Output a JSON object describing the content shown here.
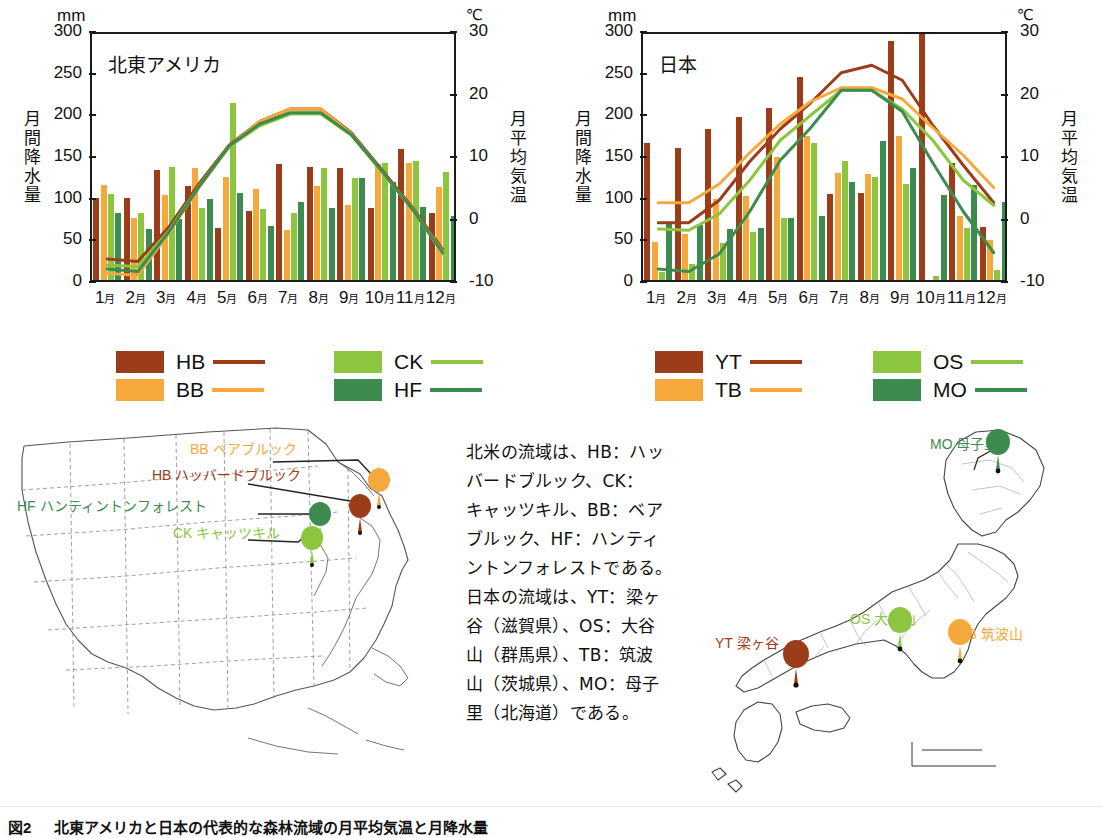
{
  "figure": {
    "caption_label": "図2",
    "caption_text": "北東アメリカと日本の代表的な森林流域の月平均気温と月降水量"
  },
  "colors": {
    "dark_red": "#9c3c19",
    "orange": "#f5a83c",
    "light_green": "#8cc63f",
    "dark_green": "#3d8b4f",
    "axis": "#1a1a1a"
  },
  "charts": [
    {
      "id": "northeast-america",
      "title": "北東アメリカ",
      "left_unit": "mm",
      "right_unit": "℃",
      "left_axis_title": "月間降水量",
      "right_axis_title": "月平均気温",
      "x_labels": [
        "1月",
        "2月",
        "3月",
        "4月",
        "5月",
        "6月",
        "7月",
        "8月",
        "9月",
        "10月",
        "11月",
        "12月"
      ],
      "y_left_ticks": [
        "0",
        "50",
        "100",
        "150",
        "200",
        "250",
        "300"
      ],
      "y_right_ticks": [
        "-10",
        "0",
        "10",
        "20",
        "30"
      ],
      "legend": [
        {
          "code": "HB",
          "color": "#9c3c19"
        },
        {
          "code": "BB",
          "color": "#f5a83c"
        },
        {
          "code": "CK",
          "color": "#8cc63f"
        },
        {
          "code": "HF",
          "color": "#3d8b4f"
        }
      ],
      "chart_data": {
        "type": "bar",
        "title": "北東アメリカ",
        "xlabel": "",
        "ylabel": "月間降水量 (mm)",
        "y2label": "月平均気温 (℃)",
        "ylim": [
          0,
          300
        ],
        "y2lim": [
          -10,
          30
        ],
        "grid": false,
        "legend_position": "below",
        "categories": [
          "1月",
          "2月",
          "3月",
          "4月",
          "5月",
          "6月",
          "7月",
          "8月",
          "9月",
          "10月",
          "11月",
          "12月"
        ],
        "series": [
          {
            "name": "HB",
            "kind": "bar",
            "axis": "left",
            "color": "#9c3c19",
            "values": [
              99,
              98,
              132,
              113,
              63,
              83,
              139,
              136,
              134,
              87,
              157,
              80
            ]
          },
          {
            "name": "BB",
            "kind": "bar",
            "axis": "left",
            "color": "#f5a83c",
            "values": [
              114,
              75,
              102,
              134,
              124,
              109,
              60,
              113,
              90,
              139,
              140,
              112
            ]
          },
          {
            "name": "CK",
            "kind": "bar",
            "axis": "left",
            "color": "#8cc63f",
            "values": [
              103,
              80,
              136,
              86,
              212,
              85,
              81,
              134,
              122,
              140,
              143,
              130
            ]
          },
          {
            "name": "HF",
            "kind": "bar",
            "axis": "left",
            "color": "#3d8b4f",
            "values": [
              80,
              61,
              73,
              97,
              104,
              65,
              94,
              87,
              123,
              118,
              88,
              77
            ]
          },
          {
            "name": "HB",
            "kind": "line",
            "axis": "right",
            "color": "#9c3c19",
            "values": [
              -6.0,
              -6.4,
              -1.0,
              6.0,
              12.2,
              16.0,
              18.0,
              18.0,
              14.2,
              8.3,
              2.3,
              -4.5
            ]
          },
          {
            "name": "BB",
            "kind": "line",
            "axis": "right",
            "color": "#f5a83c",
            "values": [
              -8.3,
              -8.6,
              -2.0,
              5.4,
              12.0,
              16.0,
              18.0,
              18.0,
              14.0,
              8.0,
              2.0,
              -4.8
            ]
          },
          {
            "name": "CK",
            "kind": "line",
            "axis": "right",
            "color": "#8cc63f",
            "values": [
              -7.0,
              -7.2,
              -1.6,
              5.6,
              12.0,
              15.3,
              17.2,
              17.2,
              13.8,
              8.0,
              2.1,
              -5.2
            ]
          },
          {
            "name": "HF",
            "kind": "line",
            "axis": "right",
            "color": "#3d8b4f",
            "values": [
              -7.6,
              -8.0,
              -1.8,
              5.5,
              12.1,
              15.6,
              17.4,
              17.4,
              13.9,
              8.1,
              2.0,
              -5.0
            ]
          }
        ]
      }
    },
    {
      "id": "japan",
      "title": "日本",
      "left_unit": "mm",
      "right_unit": "℃",
      "left_axis_title": "月間降水量",
      "right_axis_title": "月平均気温",
      "x_labels": [
        "1月",
        "2月",
        "3月",
        "4月",
        "5月",
        "6月",
        "7月",
        "8月",
        "9月",
        "10月",
        "11月",
        "12月"
      ],
      "y_left_ticks": [
        "0",
        "50",
        "100",
        "150",
        "200",
        "250",
        "300"
      ],
      "y_right_ticks": [
        "-10",
        "0",
        "10",
        "20",
        "30"
      ],
      "legend": [
        {
          "code": "YT",
          "color": "#9c3c19"
        },
        {
          "code": "TB",
          "color": "#f5a83c"
        },
        {
          "code": "OS",
          "color": "#8cc63f"
        },
        {
          "code": "MO",
          "color": "#3d8b4f"
        }
      ],
      "chart_data": {
        "type": "bar",
        "title": "日本",
        "xlabel": "",
        "ylabel": "月間降水量 (mm)",
        "y2label": "月平均気温 (℃)",
        "ylim": [
          0,
          300
        ],
        "y2lim": [
          -10,
          30
        ],
        "grid": false,
        "legend_position": "below",
        "categories": [
          "1月",
          "2月",
          "3月",
          "4月",
          "5月",
          "6月",
          "7月",
          "8月",
          "9月",
          "10月",
          "11月",
          "12月"
        ],
        "series": [
          {
            "name": "YT",
            "kind": "bar",
            "axis": "left",
            "color": "#9c3c19",
            "values": [
              164,
              158,
              181,
              196,
              206,
              244,
              103,
              104,
              287,
              301,
              141,
              64
            ]
          },
          {
            "name": "TB",
            "kind": "bar",
            "axis": "left",
            "color": "#f5a83c",
            "values": [
              46,
              55,
              97,
              101,
              148,
              173,
              129,
              127,
              173,
              0,
              77,
              48
            ]
          },
          {
            "name": "OS",
            "kind": "bar",
            "axis": "left",
            "color": "#8cc63f",
            "values": [
              10,
              19,
              44,
              58,
              75,
              165,
              143,
              124,
              115,
              5,
              62,
              12
            ]
          },
          {
            "name": "MO",
            "kind": "bar",
            "axis": "left",
            "color": "#3d8b4f",
            "values": [
              69,
              66,
              61,
              63,
              75,
              77,
              118,
              167,
              134,
              102,
              114,
              94
            ]
          },
          {
            "name": "YT",
            "kind": "line",
            "axis": "right",
            "color": "#9c3c19",
            "values": [
              -0.2,
              -0.2,
              3.4,
              9.6,
              14.8,
              19.0,
              23.8,
              25.0,
              22.6,
              15.4,
              9.0,
              3.0
            ]
          },
          {
            "name": "TB",
            "kind": "line",
            "axis": "right",
            "color": "#f5a83c",
            "values": [
              3.0,
              3.0,
              6.0,
              11.0,
              15.6,
              19.2,
              21.4,
              21.4,
              19.6,
              15.0,
              10.6,
              5.4
            ]
          },
          {
            "name": "OS",
            "kind": "line",
            "axis": "right",
            "color": "#8cc63f",
            "values": [
              -1.2,
              -1.4,
              1.2,
              6.6,
              13.0,
              17.0,
              21.0,
              21.0,
              18.0,
              13.0,
              6.6,
              2.6
            ]
          },
          {
            "name": "MO",
            "kind": "line",
            "axis": "right",
            "color": "#3d8b4f",
            "values": [
              -7.6,
              -8.0,
              -5.2,
              1.6,
              9.8,
              15.0,
              21.0,
              21.0,
              17.6,
              9.4,
              1.6,
              -5.0
            ]
          }
        ]
      }
    }
  ],
  "us_map": {
    "labels": [
      {
        "code": "BB",
        "name": "ベアブルック",
        "color": "#f5a83c"
      },
      {
        "code": "HB",
        "name": "ハッバードブルック",
        "color": "#9c3c19"
      },
      {
        "code": "HF",
        "name": "ハンティントンフォレスト",
        "color": "#3d8b4f"
      },
      {
        "code": "CK",
        "name": "キャッツキル",
        "color": "#8cc63f"
      }
    ]
  },
  "japan_map": {
    "labels": [
      {
        "code": "MO",
        "name": "母子里",
        "color": "#3d8b4f"
      },
      {
        "code": "OS",
        "name": "大谷山",
        "color": "#8cc63f"
      },
      {
        "code": "TB",
        "name": "筑波山",
        "color": "#f5a83c"
      },
      {
        "code": "YT",
        "name": "梁ヶ谷",
        "color": "#9c3c19"
      }
    ]
  },
  "blurb": {
    "lines": [
      "北米の流域は、HB：ハッ",
      "バードブルック、CK：",
      "キャッツキル、BB：ベア",
      "ブルック、HF：ハンティ",
      "ントンフォレストである。",
      "日本の流域は、YT：梁ヶ",
      "谷（滋賀県）、OS：大谷",
      "山（群馬県）、TB：筑波",
      "山（茨城県）、MO：母子",
      "里（北海道）である。"
    ]
  }
}
